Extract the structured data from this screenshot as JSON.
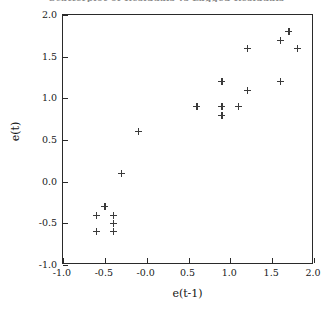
{
  "figure": {
    "title": "Scatterplot of Residuals vs Lagged Residuals"
  },
  "chart_data": {
    "type": "scatter",
    "title": "Scatterplot of Residuals vs Lagged Residuals",
    "xlabel": "e(t-1)",
    "ylabel": "e(t)",
    "xlim": [
      -1.0,
      2.0
    ],
    "ylim": [
      -1.0,
      2.0
    ],
    "grid": false,
    "legend": null,
    "marker": "plus",
    "marker_color": "#3a3a3a",
    "xticks": [
      -1.0,
      -0.5,
      -0.0,
      0.5,
      1.0,
      1.5,
      2.0
    ],
    "xtick_labels": [
      "-1.0",
      "-0.5",
      "-0.0",
      "0.5",
      "1.0",
      "1.5",
      "2.0"
    ],
    "yticks": [
      -1.0,
      -0.5,
      0.0,
      0.5,
      1.0,
      1.5,
      2.0
    ],
    "ytick_labels": [
      "-1.0",
      "-0.5",
      "0.0",
      "0.5",
      "1.0",
      "1.5",
      "2.0"
    ],
    "x": [
      -0.5,
      -0.6,
      -0.4,
      -0.4,
      -0.6,
      -0.4,
      -0.3,
      -0.1,
      0.6,
      0.9,
      0.9,
      0.9,
      1.1,
      1.2,
      1.2,
      1.6,
      1.6,
      1.7,
      1.8
    ],
    "y": [
      -0.3,
      -0.4,
      -0.4,
      -0.5,
      -0.6,
      -0.6,
      0.1,
      0.6,
      0.9,
      1.2,
      0.9,
      0.8,
      0.9,
      1.1,
      1.6,
      1.2,
      1.7,
      1.8,
      1.6
    ],
    "points": [
      {
        "x": -0.5,
        "y": -0.3
      },
      {
        "x": -0.6,
        "y": -0.4
      },
      {
        "x": -0.4,
        "y": -0.4
      },
      {
        "x": -0.4,
        "y": -0.5
      },
      {
        "x": -0.6,
        "y": -0.6
      },
      {
        "x": -0.4,
        "y": -0.6
      },
      {
        "x": -0.3,
        "y": 0.1
      },
      {
        "x": -0.1,
        "y": 0.6
      },
      {
        "x": 0.6,
        "y": 0.9
      },
      {
        "x": 0.9,
        "y": 1.2
      },
      {
        "x": 0.9,
        "y": 0.9
      },
      {
        "x": 0.9,
        "y": 0.8
      },
      {
        "x": 1.1,
        "y": 0.9
      },
      {
        "x": 1.2,
        "y": 1.1
      },
      {
        "x": 1.2,
        "y": 1.6
      },
      {
        "x": 1.6,
        "y": 1.2
      },
      {
        "x": 1.6,
        "y": 1.7
      },
      {
        "x": 1.7,
        "y": 1.8
      },
      {
        "x": 1.8,
        "y": 1.6
      }
    ]
  }
}
